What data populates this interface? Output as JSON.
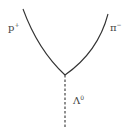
{
  "diagram": {
    "type": "particle-decay",
    "colors": {
      "line": "#333333",
      "text": "#444444",
      "background": "#ffffff"
    },
    "vertex": {
      "x": 65,
      "y": 75
    },
    "tracks": [
      {
        "id": "proton",
        "symbol": "p",
        "charge": "+",
        "style": "solid-curve",
        "start": {
          "x": 23,
          "y": 9
        }
      },
      {
        "id": "pion",
        "symbol": "π",
        "charge": "−",
        "style": "solid-curve",
        "start": {
          "x": 108,
          "y": 14
        }
      },
      {
        "id": "lambda",
        "symbol": "Λ",
        "charge": "0",
        "style": "dashed",
        "end": {
          "x": 65,
          "y": 128
        }
      }
    ]
  },
  "labels": {
    "proton": {
      "base": "p",
      "sup": "+"
    },
    "pion": {
      "base": "π",
      "sup": "−"
    },
    "lambda": {
      "base": "Λ",
      "sup": "0"
    }
  }
}
